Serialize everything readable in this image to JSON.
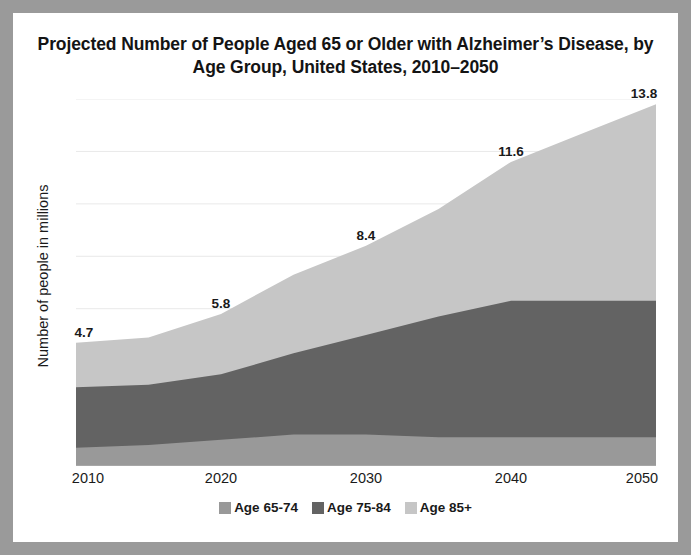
{
  "figure": {
    "background": "#ffffff",
    "frame_color": "#9a9a9a"
  },
  "title": "Projected Number of People Aged 65 or Older with Alzheimer’s Disease, by  Age Group, United States, 2010–2050",
  "y_axis_title": "Number of people in millions",
  "legend": {
    "items": [
      {
        "label": "Age 65-74",
        "color": "#999999"
      },
      {
        "label": "Age 75-84",
        "color": "#636363"
      },
      {
        "label": "Age 85+",
        "color": "#c6c6c6"
      }
    ]
  },
  "chart_data": {
    "type": "area",
    "stacked": true,
    "title": "Projected Number of People Aged 65 or Older with Alzheimer’s Disease, by  Age Group, United States, 2010–2050",
    "xlabel": "",
    "ylabel": "Number of people in millions",
    "x": [
      2010,
      2015,
      2020,
      2025,
      2030,
      2035,
      2040,
      2045,
      2050
    ],
    "tick_labels": [
      "2010",
      "2020",
      "2030",
      "2040",
      "2050"
    ],
    "tick_values": [
      2010,
      2020,
      2030,
      2040,
      2050
    ],
    "xlim": [
      2010,
      2050
    ],
    "ylim": [
      0,
      14
    ],
    "grid": true,
    "gridlines": [
      2,
      4,
      6,
      8,
      10,
      12,
      14
    ],
    "legend_position": "bottom",
    "series": [
      {
        "name": "Age 65-74",
        "color": "#999999",
        "values": [
          0.7,
          0.8,
          1.0,
          1.2,
          1.2,
          1.1,
          1.1,
          1.1,
          1.1
        ]
      },
      {
        "name": "Age 75-84",
        "color": "#636363",
        "values": [
          2.3,
          2.3,
          2.5,
          3.1,
          3.8,
          4.6,
          5.2,
          5.2,
          5.2
        ]
      },
      {
        "name": "Age 85+",
        "color": "#c6c6c6",
        "values": [
          1.7,
          1.8,
          2.3,
          3.0,
          3.4,
          4.1,
          5.3,
          6.4,
          7.5
        ]
      }
    ],
    "totals": [
      4.7,
      4.9,
      5.8,
      7.3,
      8.4,
      9.8,
      11.6,
      12.7,
      13.8
    ],
    "data_labels": [
      {
        "x": 2010,
        "value": "4.7"
      },
      {
        "x": 2020,
        "value": "5.8"
      },
      {
        "x": 2030,
        "value": "8.4"
      },
      {
        "x": 2040,
        "value": "11.6"
      },
      {
        "x": 2050,
        "value": "13.8"
      }
    ]
  }
}
